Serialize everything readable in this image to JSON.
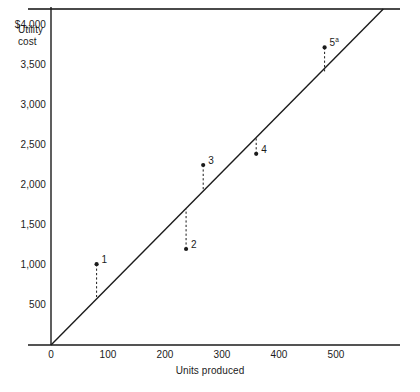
{
  "figure": {
    "top_rule": true,
    "background": "#ffffff",
    "ink_color": "#1b1b1b"
  },
  "chart_data": {
    "type": "scatter",
    "title": "",
    "xlabel": "Units produced",
    "ylabel": "Utility\ncost",
    "ylabel_lines": [
      "Utility",
      "cost"
    ],
    "xlim": [
      0,
      600
    ],
    "ylim": [
      0,
      4000
    ],
    "grid": false,
    "legend": null,
    "x_ticks": [
      0,
      100,
      200,
      300,
      400,
      500
    ],
    "x_tick_labels": [
      "0",
      "100",
      "200",
      "300",
      "400",
      "500"
    ],
    "y_ticks": [
      500,
      1000,
      1500,
      2000,
      2500,
      3000,
      3500,
      4000
    ],
    "y_tick_labels": [
      "500",
      "1,000",
      "1,500",
      "2,000",
      "2,500",
      "3,000",
      "3,500",
      "$4,000"
    ],
    "points": [
      {
        "label": "1",
        "superscript": "",
        "x": 80,
        "y": 1010,
        "line_y": 600,
        "leader": "down"
      },
      {
        "label": "2",
        "superscript": "",
        "x": 237,
        "y": 1200,
        "line_y": 1700,
        "leader": "up"
      },
      {
        "label": "3",
        "superscript": "",
        "x": 267,
        "y": 2250,
        "line_y": 1930,
        "leader": "down"
      },
      {
        "label": "4",
        "superscript": "",
        "x": 360,
        "y": 2390,
        "line_y": 2600,
        "leader": "up"
      },
      {
        "label": "5",
        "superscript": "a",
        "x": 480,
        "y": 3720,
        "line_y": 3420,
        "leader": "down"
      }
    ],
    "fit_line": {
      "x_start": 0,
      "y_start": 0,
      "x_end": 583,
      "y_end": 4200,
      "style": "solid"
    },
    "series_note": "Five observed cost points plotted against a fitted straight cost line through the origin."
  }
}
